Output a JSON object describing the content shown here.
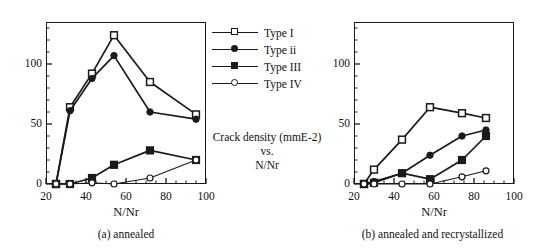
{
  "figure": {
    "center_note": {
      "line1": "Crack density (mmE-2)",
      "line2": "vs.",
      "line3": "N/Nr"
    }
  },
  "legend": {
    "position": "center",
    "entries": [
      {
        "label": "Type I",
        "marker": "open-square",
        "color": "#1a1a1a"
      },
      {
        "label": "Type ii",
        "marker": "filled-circle",
        "color": "#1a1a1a"
      },
      {
        "label": "Type III",
        "marker": "filled-square",
        "color": "#1a1a1a"
      },
      {
        "label": "Type IV",
        "marker": "open-circle",
        "color": "#1a1a1a"
      }
    ]
  },
  "panel_a": {
    "caption": "(a)  annealed",
    "xlabel": "N/Nr",
    "xticks": [
      "20",
      "40",
      "60",
      "80",
      "100"
    ],
    "yticks": [
      "0",
      "50",
      "100"
    ]
  },
  "panel_b": {
    "caption": "(b) annealed and recrystallized",
    "xlabel": "N/Nr",
    "xticks": [
      "20",
      "40",
      "60",
      "80",
      "100"
    ],
    "yticks": [
      "0",
      "50",
      "100"
    ]
  },
  "chart_data": [
    {
      "id": "panel_a",
      "type": "line",
      "title": "(a)  annealed",
      "xlabel": "N/Nr",
      "ylabel": "Crack density (mmE-2)",
      "xlim": [
        20,
        100
      ],
      "ylim": [
        0,
        135
      ],
      "xticks": [
        20,
        40,
        60,
        80,
        100
      ],
      "yticks": [
        0,
        50,
        100
      ],
      "grid": false,
      "series": [
        {
          "name": "Type I",
          "marker": "open-square",
          "color": "#1a1a1a",
          "x": [
            25,
            32,
            43,
            54,
            72,
            95
          ],
          "y": [
            0,
            64,
            92,
            124,
            85,
            58
          ]
        },
        {
          "name": "Type ii",
          "marker": "filled-circle",
          "color": "#1a1a1a",
          "x": [
            25,
            32,
            43,
            54,
            72,
            95
          ],
          "y": [
            0,
            61,
            88,
            107,
            60,
            54
          ]
        },
        {
          "name": "Type III",
          "marker": "filled-square",
          "color": "#1a1a1a",
          "x": [
            25,
            32,
            43,
            54,
            72,
            95
          ],
          "y": [
            0,
            0,
            5,
            16,
            28,
            20
          ]
        },
        {
          "name": "Type IV",
          "marker": "open-circle",
          "color": "#1a1a1a",
          "x": [
            25,
            32,
            43,
            54,
            72,
            95
          ],
          "y": [
            0,
            0,
            1,
            0,
            5,
            20
          ]
        }
      ]
    },
    {
      "id": "panel_b",
      "type": "line",
      "title": "(b) annealed and recrystallized",
      "xlabel": "N/Nr",
      "ylabel": "Crack density (mmE-2)",
      "xlim": [
        20,
        100
      ],
      "ylim": [
        0,
        135
      ],
      "xticks": [
        20,
        40,
        60,
        80,
        100
      ],
      "yticks": [
        0,
        50,
        100
      ],
      "grid": false,
      "series": [
        {
          "name": "Type I",
          "marker": "open-square",
          "color": "#1a1a1a",
          "x": [
            25,
            30,
            44,
            58,
            74,
            86
          ],
          "y": [
            0,
            12,
            37,
            64,
            59,
            55
          ]
        },
        {
          "name": "Type ii",
          "marker": "filled-circle",
          "color": "#1a1a1a",
          "x": [
            25,
            30,
            44,
            58,
            74,
            86
          ],
          "y": [
            0,
            2,
            9,
            24,
            40,
            45
          ]
        },
        {
          "name": "Type III",
          "marker": "filled-square",
          "color": "#1a1a1a",
          "x": [
            25,
            30,
            44,
            58,
            74,
            86
          ],
          "y": [
            0,
            1,
            9,
            4,
            20,
            40
          ]
        },
        {
          "name": "Type IV",
          "marker": "open-circle",
          "color": "#1a1a1a",
          "x": [
            25,
            30,
            44,
            58,
            74,
            86
          ],
          "y": [
            0,
            0,
            0,
            0,
            6,
            11
          ]
        }
      ]
    }
  ]
}
